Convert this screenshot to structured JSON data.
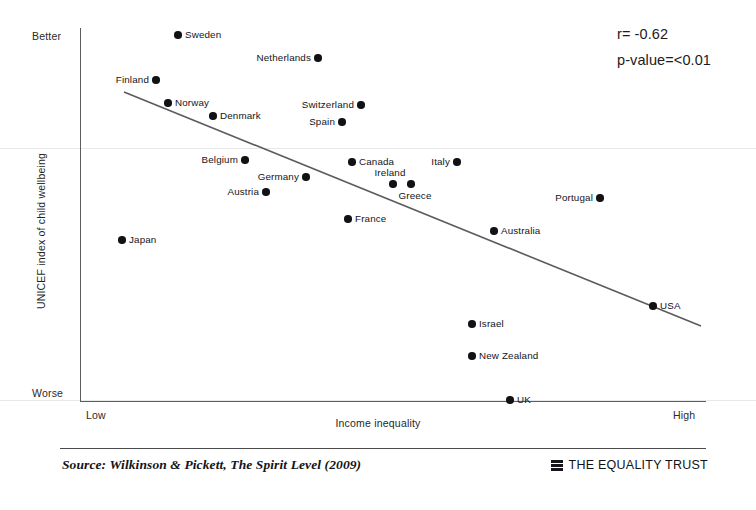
{
  "chart_data": {
    "type": "scatter",
    "title": "",
    "xlabel": "Income inequality",
    "ylabel": "UNICEF index of child wellbeing",
    "xticklabels": [
      "Low",
      "High"
    ],
    "yticklabels": [
      "Better",
      "Worse"
    ],
    "xlim": [
      "Low",
      "High"
    ],
    "ylim": [
      "Worse",
      "Better"
    ],
    "grid": false,
    "legend": "none",
    "axes_pixel_box": {
      "left": 81,
      "top": 28,
      "right": 705,
      "bottom": 401
    },
    "annotations": {
      "correlation": "r= -0.62",
      "significance": "p-value=<0.01"
    },
    "trend_line": {
      "visible": true,
      "x_start_px": 124,
      "y_start_px": 92,
      "x_end_px": 701,
      "y_end_px": 326
    },
    "points": [
      {
        "name": "Sweden",
        "x_px": 178,
        "y_px": 35,
        "label_side": "right"
      },
      {
        "name": "Netherlands",
        "x_px": 318,
        "y_px": 58,
        "label_side": "left"
      },
      {
        "name": "Finland",
        "x_px": 156,
        "y_px": 80,
        "label_side": "left"
      },
      {
        "name": "Norway",
        "x_px": 168,
        "y_px": 103,
        "label_side": "right"
      },
      {
        "name": "Switzerland",
        "x_px": 361,
        "y_px": 105,
        "label_side": "left"
      },
      {
        "name": "Denmark",
        "x_px": 213,
        "y_px": 116,
        "label_side": "right"
      },
      {
        "name": "Spain",
        "x_px": 342,
        "y_px": 122,
        "label_side": "left"
      },
      {
        "name": "Canada",
        "x_px": 352,
        "y_px": 162,
        "label_side": "right"
      },
      {
        "name": "Italy",
        "x_px": 457,
        "y_px": 162,
        "label_side": "left"
      },
      {
        "name": "Belgium",
        "x_px": 245,
        "y_px": 160,
        "label_side": "left"
      },
      {
        "name": "Ireland",
        "x_px": 393,
        "y_px": 184,
        "label_side": "above"
      },
      {
        "name": "Germany",
        "x_px": 306,
        "y_px": 177,
        "label_side": "left"
      },
      {
        "name": "Greece",
        "x_px": 411,
        "y_px": 184,
        "label_side": "below"
      },
      {
        "name": "Austria",
        "x_px": 266,
        "y_px": 192,
        "label_side": "left"
      },
      {
        "name": "Portugal",
        "x_px": 600,
        "y_px": 198,
        "label_side": "left"
      },
      {
        "name": "France",
        "x_px": 348,
        "y_px": 219,
        "label_side": "right"
      },
      {
        "name": "Australia",
        "x_px": 494,
        "y_px": 231,
        "label_side": "right"
      },
      {
        "name": "Japan",
        "x_px": 122,
        "y_px": 240,
        "label_side": "right"
      },
      {
        "name": "USA",
        "x_px": 653,
        "y_px": 306,
        "label_side": "right"
      },
      {
        "name": "Israel",
        "x_px": 472,
        "y_px": 324,
        "label_side": "right"
      },
      {
        "name": "New Zealand",
        "x_px": 472,
        "y_px": 356,
        "label_side": "right"
      },
      {
        "name": "UK",
        "x_px": 510,
        "y_px": 400,
        "label_side": "right"
      }
    ]
  },
  "footer": {
    "source": "Source: Wilkinson & Pickett, The Spirit Level (2009)",
    "organisation": "THE EQUALITY TRUST"
  },
  "colors": {
    "point": "#111116",
    "axis": "#5d5d5d",
    "text": "#14141a",
    "background": "#ffffff"
  }
}
